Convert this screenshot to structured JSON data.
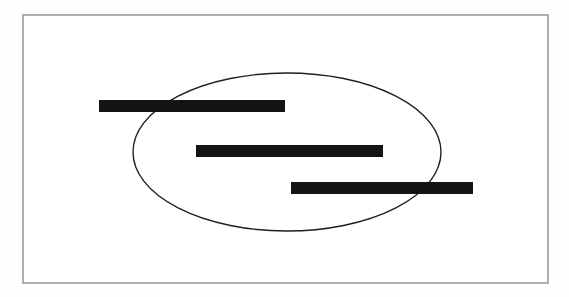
{
  "figure": {
    "title": "Scanned diagram with redaction bars",
    "kind": "scanned-line-drawing",
    "canvas": {
      "width": 569,
      "height": 297,
      "background_color": "#fefefe",
      "page_color": "#ffffff"
    },
    "frame": {
      "name": "outer-border-rectangle",
      "x": 23,
      "y": 15,
      "width": 525,
      "height": 268,
      "stroke_color": "#9a9a9a",
      "stroke_width": 1.6,
      "fill_color": "#ffffff",
      "label": ""
    },
    "ellipse": {
      "name": "hand-drawn-ellipse",
      "center_x": 287,
      "center_y": 152,
      "radius_x": 154,
      "radius_y": 79,
      "stroke_color": "#1f1f1f",
      "stroke_width": 1.4,
      "fill": "none",
      "label": ""
    },
    "redaction_bars": [
      {
        "name": "redaction-bar-top",
        "order": 1,
        "x": 99,
        "y": 100,
        "width": 186,
        "height": 12,
        "color": "#141414",
        "label": ""
      },
      {
        "name": "redaction-bar-middle",
        "order": 2,
        "x": 196,
        "y": 145,
        "width": 187,
        "height": 12,
        "color": "#141414",
        "label": ""
      },
      {
        "name": "redaction-bar-bottom",
        "order": 3,
        "x": 291,
        "y": 182,
        "width": 182,
        "height": 12,
        "color": "#141414",
        "label": ""
      }
    ],
    "notes": {
      "visible_text": "",
      "accent_color": "#141414",
      "frame_color": "#9a9a9a"
    }
  }
}
